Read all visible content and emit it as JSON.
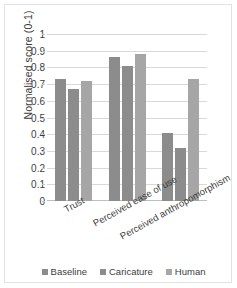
{
  "chart_data": {
    "type": "bar",
    "title": "",
    "subtitle": "",
    "xlabel": "",
    "ylabel": "Normalised score (0-1)",
    "ylim": [
      0,
      1
    ],
    "ytick_labels": [
      "1",
      "0.9",
      "0.8",
      "0.7",
      "0.6",
      "0.5",
      "0.4",
      "0.3",
      "0.2",
      "0.1",
      "0"
    ],
    "ytick_values": [
      1,
      0.9,
      0.8,
      0.7,
      0.6,
      0.5,
      0.4,
      0.3,
      0.2,
      0.1,
      0
    ],
    "grid": true,
    "legend_position": "bottom",
    "categories": [
      "Trust",
      "Perceived ease of use",
      "Perceived anthropomorphism"
    ],
    "series": [
      {
        "name": "Baseline",
        "color": "#8c8c8c",
        "values": [
          0.73,
          0.86,
          0.41
        ]
      },
      {
        "name": "Caricature",
        "color": "#8c8c8c",
        "values": [
          0.67,
          0.81,
          0.32
        ]
      },
      {
        "name": "Human",
        "color": "#a6a6a6",
        "values": [
          0.72,
          0.88,
          0.73
        ]
      }
    ]
  },
  "style": {
    "gridline_color": "#d9d9d9",
    "axis_color": "#bfbfbf",
    "text_color": "#3d3d3d",
    "frame_color": "#e2e2e2",
    "background": "#ffffff"
  }
}
